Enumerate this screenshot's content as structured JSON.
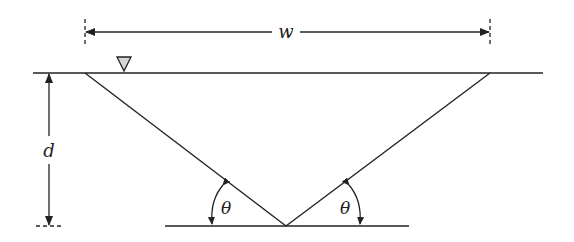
{
  "diagram": {
    "type": "triangular channel cross-section",
    "labels": {
      "width": "w",
      "depth": "d",
      "angle_left": "θ",
      "angle_right": "θ"
    },
    "symbols": {
      "water_surface": "inverted-triangle-icon"
    },
    "colors": {
      "line": "#222222",
      "water_symbol_fill": "#d6d6d6",
      "background": "#ffffff"
    }
  }
}
